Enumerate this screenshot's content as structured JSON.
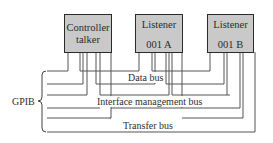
{
  "diagram": {
    "bracket_label": "GPIB",
    "devices": [
      {
        "line1": "Controller",
        "line2": "talker"
      },
      {
        "line1": "Listener",
        "line2": "001 A"
      },
      {
        "line1": "Listener",
        "line2": "001 B"
      }
    ],
    "buses": [
      {
        "label": "Data bus"
      },
      {
        "label": "Interface management bus"
      },
      {
        "label": "Transfer bus"
      }
    ],
    "colors": {
      "box_fill": "#c9c9c9",
      "box_border": "#2a2a2a",
      "line": "#555555",
      "text": "#2e2e2e"
    }
  }
}
